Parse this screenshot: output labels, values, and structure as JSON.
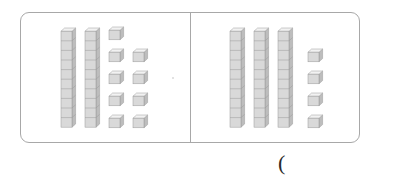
{
  "worksheet": {
    "title": "Base-ten blocks comparison",
    "frame_border_color": "#a8a8a8",
    "background_color": "#ffffff",
    "block_face_color": "#d9d9d9",
    "block_top_color": "#f2f2f2",
    "block_side_color": "#bdbdbd",
    "block_outline_color": "#9a9a9a"
  },
  "panels": [
    {
      "name": "left-panel",
      "rods": 2,
      "rod_segments": 10,
      "units": 9,
      "unit_rows": [
        1,
        2,
        2,
        2,
        2
      ],
      "tens_value": 20,
      "ones_value": 9,
      "total_value": 29
    },
    {
      "name": "right-panel",
      "rods": 3,
      "rod_segments": 10,
      "units": 4,
      "unit_rows": [
        1,
        1,
        1,
        1
      ],
      "tens_value": 30,
      "ones_value": 4,
      "total_value": 34
    }
  ],
  "annotation": {
    "paren": "(",
    "paren_label": "open-parenthesis"
  }
}
